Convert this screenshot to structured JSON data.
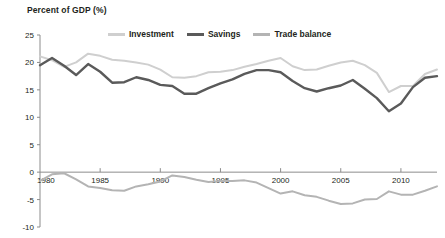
{
  "chart_data": {
    "type": "line",
    "title": "Percent of GDP (%)",
    "xlabel": "",
    "ylabel": "Percent of GDP (%)",
    "ylim": [
      -10,
      25
    ],
    "xlim": [
      1980,
      2013
    ],
    "yticks": [
      25,
      20,
      15,
      10,
      5,
      0,
      -5,
      -10
    ],
    "xticks": [
      1980,
      1985,
      1990,
      1995,
      2000,
      2005,
      2010
    ],
    "grid": false,
    "legend_position": "top",
    "x": [
      1980,
      1981,
      1982,
      1983,
      1984,
      1985,
      1986,
      1987,
      1988,
      1989,
      1990,
      1991,
      1992,
      1993,
      1994,
      1995,
      1996,
      1997,
      1998,
      1999,
      2000,
      2001,
      2002,
      2003,
      2004,
      2005,
      2006,
      2007,
      2008,
      2009,
      2010,
      2011,
      2012,
      2013
    ],
    "series": [
      {
        "name": "Investment",
        "color": "#cfcfcf",
        "values": [
          21.1,
          20.4,
          19.2,
          20.0,
          21.6,
          21.2,
          20.5,
          20.3,
          20.0,
          19.6,
          18.7,
          17.3,
          17.2,
          17.5,
          18.2,
          18.3,
          18.6,
          19.2,
          19.7,
          20.3,
          20.8,
          19.3,
          18.6,
          18.7,
          19.4,
          20.0,
          20.3,
          19.5,
          18.1,
          14.6,
          15.7,
          15.7,
          17.9,
          18.7
        ]
      },
      {
        "name": "Savings",
        "color": "#5a5a5a",
        "values": [
          19.5,
          20.8,
          19.4,
          17.7,
          19.7,
          18.3,
          16.3,
          16.4,
          17.3,
          16.8,
          15.9,
          15.7,
          14.3,
          14.3,
          15.3,
          16.2,
          16.9,
          17.9,
          18.6,
          18.6,
          18.2,
          16.6,
          15.3,
          14.7,
          15.3,
          15.8,
          16.8,
          15.2,
          13.5,
          11.1,
          12.5,
          15.5,
          17.2,
          17.5
        ]
      },
      {
        "name": "Trade balance",
        "color": "#b4b4b4",
        "values": [
          -1.6,
          -0.4,
          -0.2,
          -1.3,
          -2.6,
          -2.9,
          -3.3,
          -3.4,
          -2.6,
          -2.2,
          -1.7,
          -0.6,
          -0.9,
          -1.4,
          -1.8,
          -1.6,
          -1.6,
          -1.5,
          -1.9,
          -2.9,
          -3.9,
          -3.5,
          -4.2,
          -4.5,
          -5.2,
          -5.8,
          -5.7,
          -5.0,
          -4.9,
          -3.5,
          -4.1,
          -4.1,
          -3.4,
          -2.6
        ]
      }
    ]
  },
  "legend": {
    "items": [
      {
        "label": "Investment"
      },
      {
        "label": "Savings"
      },
      {
        "label": "Trade balance"
      }
    ]
  }
}
